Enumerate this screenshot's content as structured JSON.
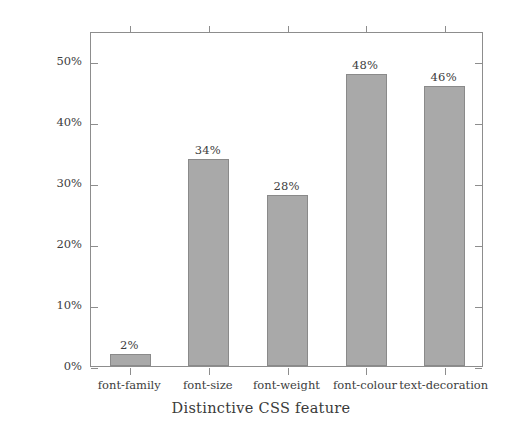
{
  "chart_data": {
    "type": "bar",
    "title": "",
    "xlabel": "Distinctive CSS feature",
    "ylabel": "e-shops in %",
    "categories": [
      "font-family",
      "font-size",
      "font-weight",
      "font-colour",
      "text-decoration"
    ],
    "values": [
      2,
      34,
      28,
      48,
      46
    ],
    "value_labels": [
      "2%",
      "34%",
      "28%",
      "48%",
      "46%"
    ],
    "ylim": [
      0,
      55
    ],
    "yticks": [
      0,
      10,
      20,
      30,
      40,
      50
    ],
    "ytick_labels": [
      "0%",
      "10%",
      "20%",
      "30%",
      "40%",
      "50%"
    ],
    "grid": false,
    "legend": null,
    "bar_color": "#a9a9a9",
    "bar_edge_color": "#8a8a8a",
    "axis_color": "#8d8d8d",
    "background": "#ffffff"
  }
}
